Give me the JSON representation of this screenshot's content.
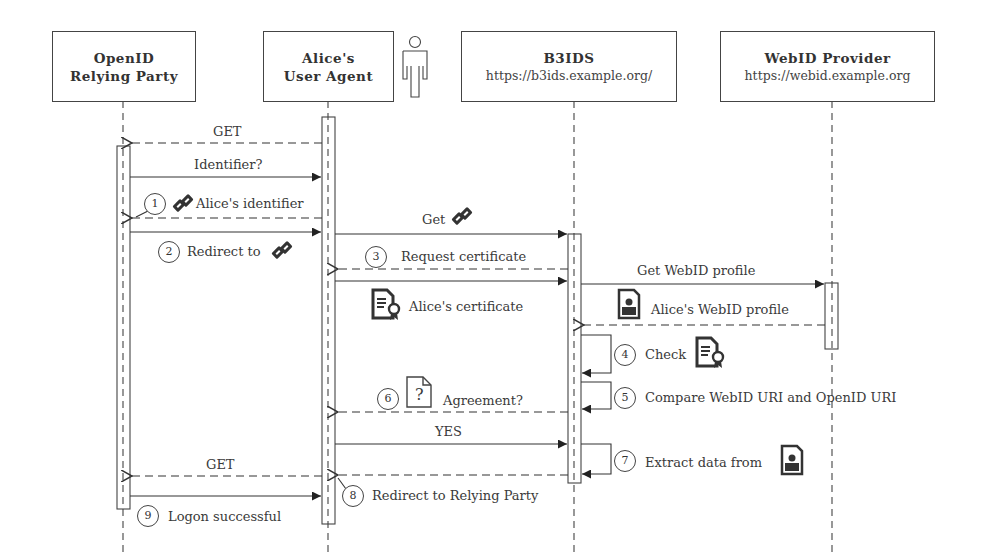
{
  "participants": [
    {
      "title": "OpenID",
      "title2": "Relying Party",
      "url": ""
    },
    {
      "title": "Alice's",
      "title2": "User Agent",
      "url": ""
    },
    {
      "title": "B3IDS",
      "url": "https://b3ids.example.org/"
    },
    {
      "title": "WebID Provider",
      "url": "https://webid.example.org"
    }
  ],
  "messages": [
    {
      "id": "m1",
      "from": "User Agent",
      "to": "Relying Party",
      "label": "GET",
      "style": "dashed"
    },
    {
      "id": "m2",
      "from": "Relying Party",
      "to": "User Agent",
      "label": "Identifier?",
      "style": "solid"
    },
    {
      "id": "m3",
      "step": "1",
      "from": "User Agent",
      "to": "Relying Party",
      "label": "Alice's identifier",
      "icon": "link-icon",
      "style": "dashed"
    },
    {
      "id": "m4",
      "step": "2",
      "from": "Relying Party",
      "to": "User Agent",
      "label": "Redirect to",
      "icon": "link-icon",
      "style": "solid"
    },
    {
      "id": "m5",
      "from": "User Agent",
      "to": "B3IDS",
      "label": "Get",
      "icon": "link-icon",
      "style": "solid"
    },
    {
      "id": "m6",
      "step": "3",
      "from": "B3IDS",
      "to": "User Agent",
      "label": "Request certificate",
      "style": "dashed"
    },
    {
      "id": "m7",
      "from": "User Agent",
      "to": "B3IDS",
      "label": "Alice's certificate",
      "icon": "certificate-icon",
      "style": "solid"
    },
    {
      "id": "m8",
      "from": "B3IDS",
      "to": "WebID Provider",
      "label": "Get WebID profile",
      "style": "solid"
    },
    {
      "id": "m9",
      "from": "WebID Provider",
      "to": "B3IDS",
      "label": "Alice's WebID profile",
      "icon": "profile-document-icon",
      "style": "dashed"
    },
    {
      "id": "m10",
      "step": "4",
      "from": "B3IDS",
      "to": "B3IDS",
      "label": "Check",
      "icon": "certificate-icon",
      "style": "self"
    },
    {
      "id": "m11",
      "step": "5",
      "from": "B3IDS",
      "to": "B3IDS",
      "label": "Compare WebID URI and OpenID URI",
      "style": "self"
    },
    {
      "id": "m12",
      "step": "6",
      "from": "B3IDS",
      "to": "User Agent",
      "label": "Agreement?",
      "icon": "question-document-icon",
      "style": "dashed"
    },
    {
      "id": "m13",
      "from": "User Agent",
      "to": "B3IDS",
      "label": "YES",
      "style": "solid"
    },
    {
      "id": "m14",
      "step": "7",
      "from": "B3IDS",
      "to": "B3IDS",
      "label": "Extract data from",
      "icon": "profile-document-icon",
      "style": "self"
    },
    {
      "id": "m15",
      "from": "User Agent",
      "to": "Relying Party",
      "label": "GET",
      "style": "dashed"
    },
    {
      "id": "m16",
      "step": "8",
      "from": "B3IDS",
      "to": "User Agent",
      "label": "Redirect to Relying Party",
      "style": "dashed"
    },
    {
      "id": "m17",
      "from": "Relying Party",
      "to": "User Agent",
      "label": "",
      "style": "solid"
    },
    {
      "id": "m18",
      "step": "9",
      "label": "Logon successful",
      "style": "note"
    }
  ],
  "icons": {
    "question_mark": "?"
  }
}
